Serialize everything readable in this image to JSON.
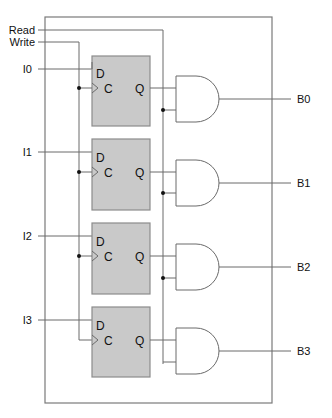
{
  "diagram": {
    "type": "register-circuit",
    "control_inputs": {
      "read": "Read",
      "write": "Write"
    },
    "data_inputs": [
      "I0",
      "I1",
      "I2",
      "I3"
    ],
    "outputs": [
      "B0",
      "B1",
      "B2",
      "B3"
    ],
    "flip_flop_pins": {
      "d": "D",
      "c": "C",
      "q": "Q"
    },
    "colors": {
      "flip_flop_fill": "#c9c9c9",
      "wire": "#6a6a6a",
      "outer_box": "#7a7a7a"
    },
    "cells": [
      {
        "input": "I0",
        "output": "B0"
      },
      {
        "input": "I1",
        "output": "B1"
      },
      {
        "input": "I2",
        "output": "B2"
      },
      {
        "input": "I3",
        "output": "B3"
      }
    ]
  }
}
